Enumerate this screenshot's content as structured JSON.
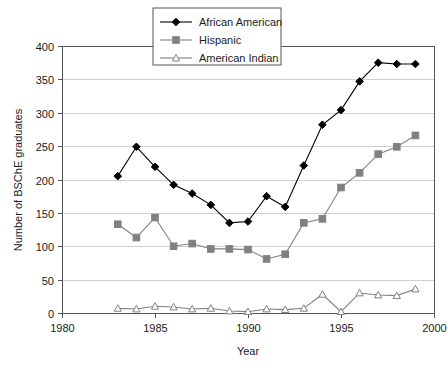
{
  "chart_data": {
    "type": "line",
    "title": "",
    "xlabel": "Year",
    "ylabel": "Number of BSChE graduates",
    "xlim": [
      1980,
      2000
    ],
    "ylim": [
      0,
      400
    ],
    "xticks": [
      1980,
      1985,
      1990,
      1995,
      2000
    ],
    "yticks": [
      0,
      50,
      100,
      150,
      200,
      250,
      300,
      350,
      400
    ],
    "xtick_labels": [
      "1980",
      "1985",
      "1990",
      "1995",
      "2000"
    ],
    "ytick_labels": [
      "0",
      "50",
      "100",
      "150",
      "200",
      "250",
      "300",
      "350",
      "400"
    ],
    "grid": "horizontal",
    "legend_position": "top-center",
    "x": [
      1983,
      1984,
      1985,
      1986,
      1987,
      1988,
      1989,
      1990,
      1991,
      1992,
      1993,
      1994,
      1995,
      1996,
      1997,
      1998,
      1999
    ],
    "series": [
      {
        "name": "African American",
        "marker": "diamond",
        "color": "#000000",
        "marker_fill": "#000000",
        "values": [
          205,
          249,
          219,
          192,
          179,
          162,
          135,
          137,
          175,
          159,
          221,
          282,
          304,
          347,
          375,
          373,
          373
        ]
      },
      {
        "name": "Hispanic",
        "marker": "square",
        "color": "#808080",
        "marker_fill": "#808080",
        "values": [
          133,
          113,
          143,
          100,
          104,
          96,
          96,
          95,
          81,
          88,
          135,
          141,
          188,
          210,
          238,
          249,
          266
        ]
      },
      {
        "name": "American Indian",
        "marker": "triangle",
        "color": "#808080",
        "marker_fill": "#ffffff",
        "values": [
          7,
          6,
          10,
          9,
          6,
          7,
          3,
          2,
          6,
          5,
          7,
          28,
          2,
          30,
          27,
          26,
          36
        ]
      }
    ]
  },
  "legend": {
    "items": [
      {
        "label": "African American"
      },
      {
        "label": "Hispanic"
      },
      {
        "label": "American Indian"
      }
    ]
  },
  "axes": {
    "y_title": "Number of BSChE graduates",
    "x_title": "Year"
  }
}
